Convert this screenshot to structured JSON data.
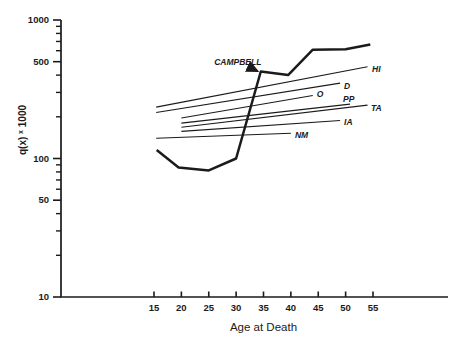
{
  "figure": {
    "background": "#ffffff",
    "ink_color": "#1b1b1b"
  },
  "chart_data": {
    "type": "line",
    "title": "",
    "xlabel": "Age at Death",
    "ylabel": "q(x) x 1000",
    "ylabel_parts": {
      "body": "q(x)",
      "superscript": "x",
      "scale": "1000"
    },
    "grid": false,
    "legend": "labels-at-line-ends",
    "x_axis": {
      "range_shown": [
        15,
        55
      ],
      "ticks": [
        15,
        20,
        25,
        30,
        35,
        40,
        45,
        50,
        55
      ],
      "tick_labels": [
        "15",
        "20",
        "25",
        "30",
        "35",
        "40",
        "45",
        "50",
        "55"
      ]
    },
    "y_axis": {
      "scale": "log",
      "range": [
        10,
        1000
      ],
      "major_ticks": [
        1000,
        500,
        100,
        50,
        10
      ],
      "major_tick_labels": [
        "1000",
        "500",
        "100",
        "50",
        "10"
      ],
      "minor_ticks": [
        900,
        800,
        700,
        600,
        400,
        300,
        200,
        90,
        80,
        70,
        60,
        40,
        30,
        20
      ]
    },
    "series": [
      {
        "name": "CAMPBELL",
        "style": "bold",
        "label_via": "annotation",
        "points": [
          [
            15.5,
            115
          ],
          [
            19.5,
            86
          ],
          [
            25,
            82
          ],
          [
            30,
            100
          ],
          [
            34.5,
            425
          ],
          [
            39.5,
            400
          ],
          [
            44,
            610
          ],
          [
            50,
            615
          ],
          [
            54.5,
            665
          ]
        ]
      },
      {
        "name": "HI",
        "style": "thin",
        "points": [
          [
            15.4,
            235
          ],
          [
            54,
            460
          ]
        ],
        "label_dx": 4.5,
        "label_dy": 2.5
      },
      {
        "name": "D",
        "style": "thin",
        "points": [
          [
            15.4,
            215
          ],
          [
            49,
            350
          ]
        ],
        "label_dx": 4,
        "label_dy": 3
      },
      {
        "name": "O",
        "style": "thin",
        "points": [
          [
            20,
            196
          ],
          [
            44,
            285
          ]
        ],
        "label_dx": 4,
        "label_dy": -1.5
      },
      {
        "name": "PP",
        "style": "thin",
        "points": [
          [
            20,
            180
          ],
          [
            50.8,
            247
          ]
        ],
        "label_dx": -7,
        "label_dy": -4.5
      },
      {
        "name": "TA",
        "style": "thin",
        "points": [
          [
            20,
            168
          ],
          [
            54,
            243
          ]
        ],
        "label_dx": 3.5,
        "label_dy": 3.5
      },
      {
        "name": "IA",
        "style": "thin",
        "points": [
          [
            20,
            157
          ],
          [
            49,
            188
          ]
        ],
        "label_dx": 4,
        "label_dy": 1.5
      },
      {
        "name": "NM",
        "style": "thin",
        "points": [
          [
            15.4,
            140
          ],
          [
            40,
            152
          ]
        ],
        "label_dx": 4,
        "label_dy": 2.5
      }
    ],
    "annotation": {
      "text": "CAMPBELL",
      "label_age": 30.3,
      "label_value": 501,
      "arrow_from_age": 32.2,
      "arrow_from_value": 461,
      "arrow_to_age": 33.9,
      "arrow_to_value": 428
    }
  }
}
